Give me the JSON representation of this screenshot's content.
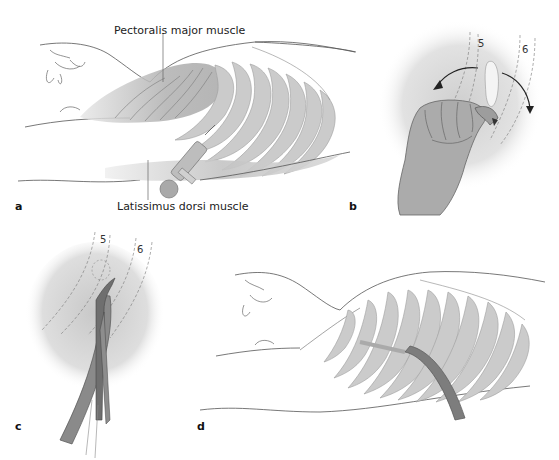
{
  "figure": {
    "panels": [
      {
        "id": "a",
        "label": "a",
        "description": "Patient supine, local anesthesia injection into chest wall"
      },
      {
        "id": "b",
        "label": "b",
        "description": "Blunt finger dissection over rib, rotation arrows"
      },
      {
        "id": "c",
        "label": "c",
        "description": "Clamp-guided insertion of chest tube between ribs"
      },
      {
        "id": "d",
        "label": "d",
        "description": "Chest tube in place between ribs"
      }
    ],
    "annotations": {
      "pectoralis": "Pectoralis major muscle",
      "latissimus": "Latissimus dorsi muscle",
      "rib5_b": "5",
      "rib6_b": "6",
      "rib5_c": "5",
      "rib6_c": "6"
    },
    "colors": {
      "rib": "#c9c9c9",
      "rib_stroke": "#9a9a9a",
      "muscle": "#b5b5b5",
      "skin_shade": "#dcdcdc",
      "outline": "#555555",
      "tube": "#7d7d7d",
      "hand": "#a9a9a9"
    }
  }
}
